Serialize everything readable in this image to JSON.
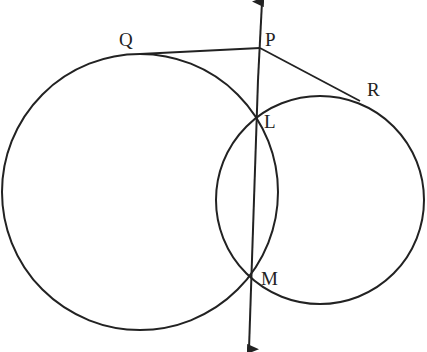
{
  "diagram": {
    "type": "geometry",
    "labels": {
      "P": "P",
      "Q": "Q",
      "R": "R",
      "L": "L",
      "M": "M"
    },
    "points": {
      "P": [
        260,
        48
      ],
      "Q": [
        158,
        53
      ],
      "R": [
        352,
        97
      ],
      "L": [
        256,
        116
      ],
      "M": [
        251,
        278
      ]
    },
    "circles": [
      {
        "name": "large-circle",
        "center": [
          140,
          192
        ],
        "r": 138
      },
      {
        "name": "small-circle",
        "center": [
          320,
          200
        ],
        "r": 104
      }
    ],
    "line_color": "#222222"
  }
}
